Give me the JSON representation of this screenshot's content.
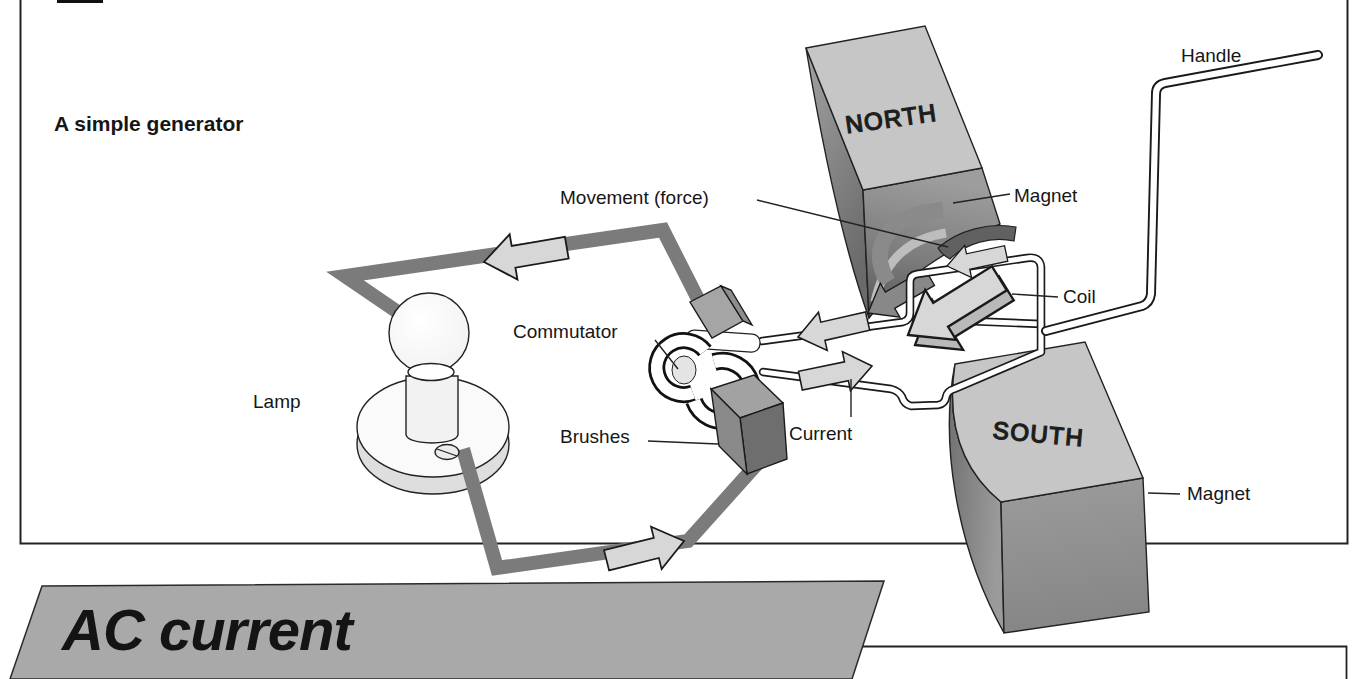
{
  "diagram": {
    "caption": "A simple generator",
    "labels": {
      "movement": "Movement (force)",
      "magnet_top": "Magnet",
      "handle": "Handle",
      "coil": "Coil",
      "commutator": "Commutator",
      "brushes": "Brushes",
      "current": "Current",
      "lamp": "Lamp",
      "magnet_bottom": "Magnet",
      "pole_north": "NORTH",
      "pole_south": "SOUTH"
    }
  },
  "section": {
    "title": "AC current"
  },
  "colors": {
    "background": "#ffffff",
    "ink": "#1a1a1a",
    "frame_stroke": "#222222",
    "banner_fill": "#a9a9a9",
    "magnet_top_face": "#c6c6c6",
    "magnet_front_face": "#949494",
    "magnet_dark_face": "#6e6e6e",
    "wire_ribbon": "#7b7b7b",
    "arrow_fill": "#d7d7d7",
    "tube_fill": "#ffffff"
  }
}
